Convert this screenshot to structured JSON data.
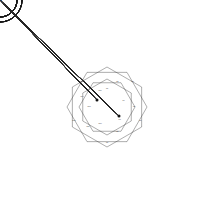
{
  "figure": {
    "background_color": "#ffffff",
    "ink_color": "#1a1a1a",
    "canvas": {
      "width": 214,
      "height": 214
    },
    "center": {
      "x": 107,
      "y": 107
    },
    "petal_count": 12,
    "hub_nodes": [
      {
        "name": "hub-upper-left",
        "x": 97,
        "y": 100
      },
      {
        "name": "hub-lower-right",
        "x": 119,
        "y": 116
      }
    ],
    "geometry": {
      "petal_center_radius": 68,
      "petal_node_radius": 17,
      "petal_ring_radius": 22,
      "petal_tip_radius": 94,
      "cross_arm": 9,
      "cross_width": 4.5
    }
  },
  "petals": [
    {
      "index": 0,
      "angle_deg": -90,
      "label": "04",
      "tip_label": "a1"
    },
    {
      "index": 1,
      "angle_deg": -60,
      "label": "05",
      "tip_label": "a2"
    },
    {
      "index": 2,
      "angle_deg": -30,
      "label": "06",
      "tip_label": "a3"
    },
    {
      "index": 3,
      "angle_deg": 0,
      "label": "07",
      "tip_label": "a4"
    },
    {
      "index": 4,
      "angle_deg": 30,
      "label": "08",
      "tip_label": "a5"
    },
    {
      "index": 5,
      "angle_deg": 60,
      "label": "09",
      "tip_label": "a6"
    },
    {
      "index": 6,
      "angle_deg": 90,
      "label": "10",
      "tip_label": "a7"
    },
    {
      "index": 7,
      "angle_deg": 120,
      "label": "11",
      "tip_label": "a8"
    },
    {
      "index": 8,
      "angle_deg": 150,
      "label": "12",
      "tip_label": "a9"
    },
    {
      "index": 9,
      "angle_deg": 180,
      "label": "01",
      "tip_label": "b1"
    },
    {
      "index": 10,
      "angle_deg": 210,
      "label": "02",
      "tip_label": "b2"
    },
    {
      "index": 11,
      "angle_deg": 240,
      "label": "03",
      "tip_label": "b3"
    }
  ],
  "node_satellite_labels": [
    "c1",
    "c2",
    "c3",
    "c4"
  ],
  "center_labels": [
    "m1",
    "m2",
    "m3",
    "m4",
    "m5",
    "m6",
    "m7",
    "m8",
    "m9",
    "m10",
    "m11",
    "m12",
    "m13",
    "m14",
    "m15",
    "m16"
  ]
}
